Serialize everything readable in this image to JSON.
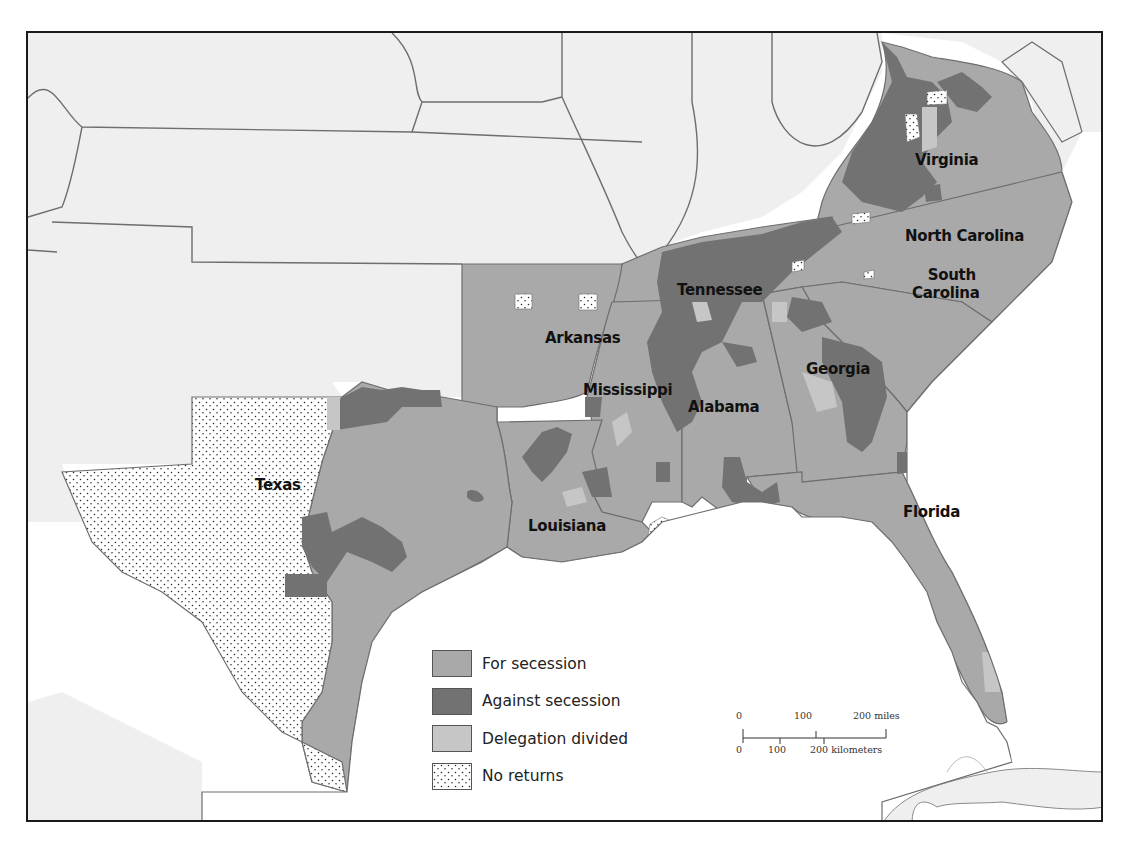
{
  "map": {
    "title": "",
    "colors": {
      "land_outside": "#efefef",
      "border": "#6e6e6e",
      "water": "#ffffff",
      "for_secession": "#a9a9a9",
      "against_secession": "#727272",
      "delegation_divided": "#c6c6c6",
      "no_returns": "#ffffff"
    },
    "states": [
      {
        "name": "Virginia",
        "label": "Virginia"
      },
      {
        "name": "North Carolina",
        "label": "North Carolina"
      },
      {
        "name": "South Carolina",
        "label_line1": "South",
        "label_line2": "Carolina"
      },
      {
        "name": "Tennessee",
        "label": "Tennessee"
      },
      {
        "name": "Arkansas",
        "label": "Arkansas"
      },
      {
        "name": "Mississippi",
        "label": "Mississippi"
      },
      {
        "name": "Alabama",
        "label": "Alabama"
      },
      {
        "name": "Georgia",
        "label": "Georgia"
      },
      {
        "name": "Texas",
        "label": "Texas"
      },
      {
        "name": "Louisiana",
        "label": "Louisiana"
      },
      {
        "name": "Florida",
        "label": "Florida"
      }
    ]
  },
  "legend": {
    "items": [
      {
        "key": "for_secession",
        "label": "For secession",
        "color": "#a9a9a9",
        "pattern": "solid"
      },
      {
        "key": "against_secession",
        "label": "Against secession",
        "color": "#727272",
        "pattern": "solid"
      },
      {
        "key": "delegation_divided",
        "label": "Delegation divided",
        "color": "#c6c6c6",
        "pattern": "solid"
      },
      {
        "key": "no_returns",
        "label": "No returns",
        "color": "#ffffff",
        "pattern": "dots"
      }
    ]
  },
  "scale": {
    "miles": {
      "ticks": [
        "0",
        "100",
        "200 miles"
      ]
    },
    "kilometers": {
      "ticks": [
        "0",
        "100",
        "200 kilometers"
      ]
    }
  }
}
